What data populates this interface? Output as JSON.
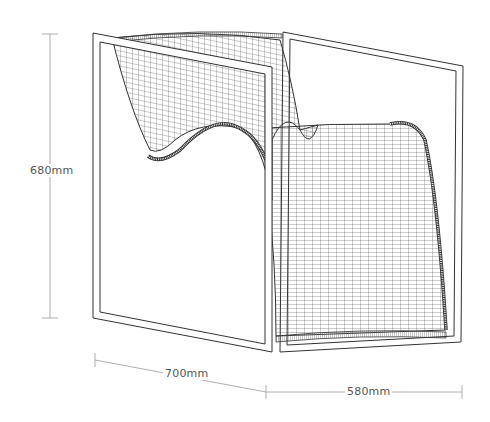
{
  "diagram": {
    "dimensions": {
      "height": {
        "label": "680mm"
      },
      "depth": {
        "label": "700mm"
      },
      "width": {
        "label": "580mm"
      }
    },
    "colors": {
      "line": "#333333",
      "mesh": "#555555",
      "dimension_line": "#9a9a9a",
      "label": "#555555",
      "background": "#ffffff"
    }
  }
}
